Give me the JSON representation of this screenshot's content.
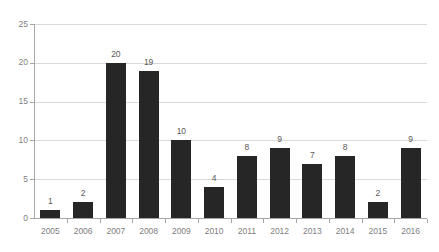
{
  "chart_data": {
    "type": "bar",
    "title": "",
    "subtitle": "",
    "xlabel": "",
    "ylabel": "",
    "categories": [
      "2005",
      "2006",
      "2007",
      "2008",
      "2009",
      "2010",
      "2011",
      "2012",
      "2013",
      "2014",
      "2015",
      "2016"
    ],
    "values": [
      1,
      2,
      20,
      19,
      10,
      4,
      8,
      9,
      7,
      8,
      2,
      9
    ],
    "ylim": [
      0,
      25
    ],
    "yticks": [
      0,
      5,
      10,
      15,
      20,
      25
    ],
    "ytick_labels": [
      "0",
      "5",
      "10",
      "15",
      "20",
      "25"
    ],
    "data_labels": [
      "1",
      "2",
      "20",
      "19",
      "10",
      "4",
      "8",
      "9",
      "7",
      "8",
      "2",
      "9"
    ],
    "grid": true,
    "grid_axis": "y",
    "legend": null,
    "legend_position": "none",
    "annotations": []
  },
  "style": {
    "bar_color": "#262626",
    "grid_color": "#d9d9d9",
    "axis_color": "#a6a6a6",
    "tick_label_color": "#808080",
    "data_label_color": "#595959",
    "background": "#ffffff"
  }
}
